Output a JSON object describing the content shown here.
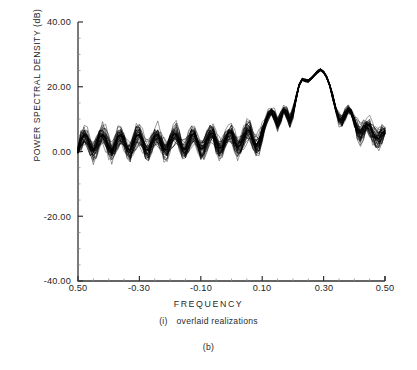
{
  "chart_data": {
    "type": "line",
    "title": "",
    "subtitle": "",
    "xlabel": "FREQUENCY",
    "ylabel": "POWER SPECTRAL DENSITY (dB)",
    "xlim": [
      -0.5,
      0.5
    ],
    "ylim": [
      -40.0,
      40.0
    ],
    "grid": false,
    "legend_position": "none",
    "xticks": [
      "0.50",
      "-0.30",
      "-0.10",
      "0.10",
      "0.30",
      "0.50"
    ],
    "xtick_values": [
      -0.5,
      -0.3,
      -0.1,
      0.1,
      0.3,
      0.5
    ],
    "yticks": [
      "40.00",
      "20.00",
      "0.00",
      "-20.00",
      "-40.00"
    ],
    "ytick_values": [
      40.0,
      20.0,
      0.0,
      -20.0,
      -40.0
    ],
    "annotations": [
      "(i)   overlaid realizations",
      "(b)"
    ],
    "series_description": "Many overlaid spectral estimate realizations forming a thick black band; oscillatory sidelobe ripple near 0 dB across most of the band with a broad main peak near f = 0.18",
    "n_realizations": 40,
    "line_color": "#000000",
    "background_color": "#ffffff",
    "series": [
      {
        "name": "mean overlaid realizations",
        "x": [
          -0.5,
          -0.49,
          -0.48,
          -0.47,
          -0.46,
          -0.45,
          -0.44,
          -0.43,
          -0.42,
          -0.41,
          -0.4,
          -0.39,
          -0.38,
          -0.37,
          -0.36,
          -0.35,
          -0.34,
          -0.33,
          -0.32,
          -0.31,
          -0.3,
          -0.29,
          -0.28,
          -0.27,
          -0.26,
          -0.25,
          -0.24,
          -0.23,
          -0.22,
          -0.21,
          -0.2,
          -0.19,
          -0.18,
          -0.17,
          -0.16,
          -0.15,
          -0.14,
          -0.13,
          -0.12,
          -0.11,
          -0.1,
          -0.09,
          -0.08,
          -0.07,
          -0.06,
          -0.05,
          -0.04,
          -0.03,
          -0.02,
          -0.01,
          0.0,
          0.01,
          0.02,
          0.03,
          0.04,
          0.05,
          0.06,
          0.07,
          0.08,
          0.09,
          0.1,
          0.11,
          0.12,
          0.13,
          0.14,
          0.15,
          0.16,
          0.17,
          0.18,
          0.19,
          0.2,
          0.21,
          0.22,
          0.23,
          0.24,
          0.25,
          0.26,
          0.27,
          0.28,
          0.29,
          0.3,
          0.31,
          0.32,
          0.33,
          0.34,
          0.35,
          0.36,
          0.37,
          0.38,
          0.39,
          0.4,
          0.41,
          0.42,
          0.43,
          0.44,
          0.45,
          0.46,
          0.47,
          0.48,
          0.49,
          0.5
        ],
        "values": [
          0.5,
          3.6,
          5.4,
          4.6,
          2.0,
          0.2,
          1.6,
          4.3,
          5.3,
          4.0,
          1.4,
          0.0,
          2.2,
          4.6,
          5.2,
          3.6,
          1.0,
          0.2,
          2.6,
          4.8,
          5.2,
          3.4,
          0.8,
          0.4,
          2.9,
          5.0,
          5.3,
          3.2,
          0.7,
          0.6,
          3.1,
          5.1,
          5.4,
          3.1,
          0.7,
          0.8,
          3.3,
          5.3,
          5.5,
          3.0,
          0.8,
          1.1,
          3.6,
          5.5,
          5.6,
          3.0,
          1.0,
          1.5,
          4.0,
          5.8,
          5.9,
          3.2,
          1.3,
          2.0,
          4.6,
          6.4,
          6.5,
          3.8,
          2.0,
          3.2,
          6.2,
          9.0,
          11.5,
          12.5,
          11.0,
          8.5,
          10.5,
          13.0,
          12.0,
          9.5,
          12.0,
          16.5,
          20.5,
          22.3,
          22.0,
          21.8,
          22.6,
          23.6,
          24.6,
          25.2,
          24.6,
          23.0,
          20.5,
          17.0,
          13.0,
          10.2,
          9.6,
          11.5,
          13.0,
          12.2,
          9.6,
          7.0,
          5.8,
          7.0,
          8.4,
          8.0,
          6.0,
          4.2,
          4.0,
          5.6,
          6.4
        ]
      }
    ]
  },
  "figure": {
    "panel_label": "(b)",
    "sub_label": "(i)",
    "sub_caption": "overlaid realizations"
  }
}
